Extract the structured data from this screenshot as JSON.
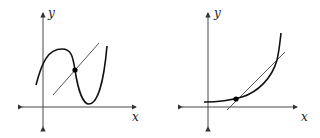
{
  "figures": [
    {
      "id": "left",
      "x_label": "x",
      "y_label": "y",
      "curve": "cubic with local max and local min",
      "secant_line": "straight line crossing curve",
      "marked_point": "intersection of curve and line at inflection region"
    },
    {
      "id": "right",
      "x_label": "x",
      "y_label": "y",
      "curve": "exponential-like increasing curve",
      "secant_line": "straight line crossing curve twice",
      "marked_point": "lower intersection of curve and line"
    }
  ],
  "colors": {
    "axis": "#333333",
    "curve": "#111111",
    "line": "#555555",
    "point": "#000000"
  }
}
